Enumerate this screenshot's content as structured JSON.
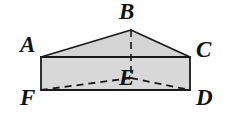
{
  "figure": {
    "kind": "geometry-diagram",
    "canvas": {
      "width": 228,
      "height": 116
    },
    "colors": {
      "background": "#ffffff",
      "face_fill": "#d8d8d8",
      "top_face_fill": "#d4d4d4",
      "stroke": "#1a1a1a",
      "label": "#111111"
    },
    "stroke_width": 1.6,
    "dash_pattern": "7 5",
    "vertices": [
      {
        "name": "A",
        "label": "A",
        "x": 41,
        "y": 57
      },
      {
        "name": "B",
        "label": "B",
        "x": 131,
        "y": 30
      },
      {
        "name": "C",
        "label": "C",
        "x": 190,
        "y": 57
      },
      {
        "name": "D",
        "label": "D",
        "x": 190,
        "y": 90
      },
      {
        "name": "E",
        "label": "E",
        "x": 131,
        "y": 78
      },
      {
        "name": "F",
        "label": "F",
        "x": 41,
        "y": 90
      }
    ],
    "solid_paths": {
      "top_face": "41,57 131,30 190,57",
      "front_face": "41,57 190,57 190,90 41,90",
      "ridge_left": "41,57 131,30",
      "ridge_right": "131,30 190,57",
      "top_edge": "41,57 190,57",
      "bottom_edge": "41,90 190,90",
      "left_edge": "41,57 41,90",
      "right_edge": "190,57 190,90"
    },
    "dashed_paths": {
      "B_to_E": "131,30 131,78",
      "E_to_F": "131,78 41,90",
      "E_to_D": "131,78 190,90"
    }
  }
}
